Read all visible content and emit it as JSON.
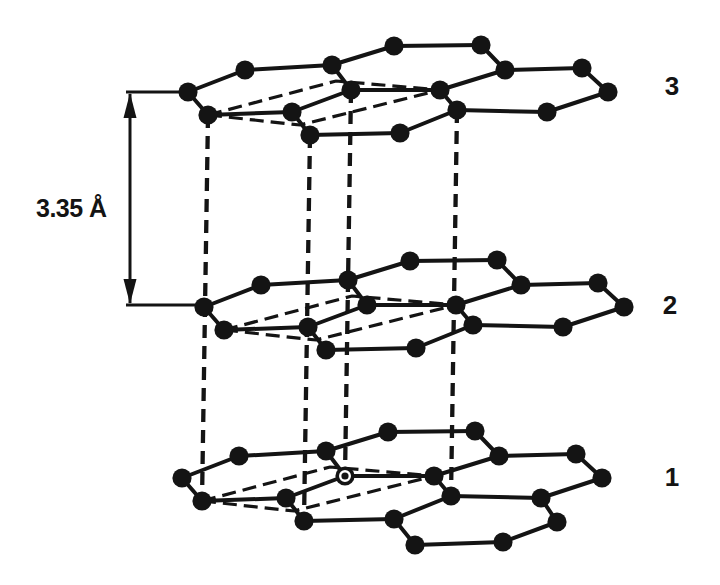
{
  "annotations": {
    "spacing_label": "3.35 Å",
    "layer_labels": [
      {
        "text": "3"
      },
      {
        "text": "2"
      },
      {
        "text": "1"
      }
    ]
  },
  "diagram": {
    "canvas": {
      "width": 720,
      "height": 585
    },
    "ink_color": "#141414",
    "background_color": "#ffffff",
    "atom_radius": 9.6,
    "template_atoms": {
      "A": [
        0,
        0
      ],
      "B": [
        57,
        -22
      ],
      "C": [
        20,
        23
      ],
      "D": [
        104,
        20
      ],
      "E": [
        144,
        -27
      ],
      "F": [
        163,
        -2
      ],
      "G": [
        122,
        43
      ],
      "H": [
        206,
        -46
      ],
      "I": [
        212,
        41
      ],
      "J": [
        252,
        -2
      ],
      "K": [
        269,
        18
      ],
      "L": [
        293,
        -47
      ],
      "M": [
        317,
        -22
      ],
      "N": [
        394,
        -24
      ],
      "O": [
        420,
        0
      ],
      "P": [
        359,
        20
      ]
    },
    "template_bonds": [
      [
        "A",
        "B"
      ],
      [
        "A",
        "C"
      ],
      [
        "B",
        "E"
      ],
      [
        "C",
        "D"
      ],
      [
        "D",
        "F"
      ],
      [
        "D",
        "G"
      ],
      [
        "E",
        "F"
      ],
      [
        "E",
        "H"
      ],
      [
        "F",
        "J"
      ],
      [
        "G",
        "I"
      ],
      [
        "H",
        "L"
      ],
      [
        "I",
        "K"
      ],
      [
        "J",
        "K"
      ],
      [
        "J",
        "M"
      ],
      [
        "L",
        "M"
      ],
      [
        "M",
        "N"
      ],
      [
        "N",
        "O"
      ],
      [
        "O",
        "P"
      ],
      [
        "P",
        "K"
      ]
    ],
    "lens_paths": [
      [
        [
          20,
          23
        ],
        [
          148,
          -11
        ],
        [
          252,
          -2
        ]
      ],
      [
        [
          20,
          23
        ],
        [
          112,
          33
        ],
        [
          252,
          -2
        ]
      ]
    ],
    "layers": [
      {
        "label": "3",
        "anchor": [
          188,
          92
        ]
      },
      {
        "label": "2",
        "anchor": [
          204,
          307
        ]
      },
      {
        "label": "1",
        "anchor": [
          182,
          478
        ],
        "extra_atoms": {
          "Q": [
            233,
            67
          ],
          "R": [
            321,
            64
          ],
          "S": [
            375,
            44
          ]
        },
        "extra_bonds": [
          [
            "I",
            "Q"
          ],
          [
            "Q",
            "R"
          ],
          [
            "R",
            "S"
          ],
          [
            "S",
            "P"
          ]
        ],
        "ringed_atom": "F"
      }
    ],
    "interlayer_bonds": [
      {
        "from": [
          0,
          "C"
        ],
        "to": [
          2,
          "C"
        ]
      },
      {
        "from": [
          0,
          "G"
        ],
        "to": [
          2,
          "G"
        ]
      },
      {
        "from": [
          0,
          "F"
        ],
        "to": [
          2,
          "F"
        ]
      },
      {
        "from": [
          0,
          "K"
        ],
        "to": [
          2,
          "K"
        ]
      }
    ],
    "spacing_arrow": {
      "x": 130,
      "y_top": 92,
      "y_bottom": 305,
      "tick_top_x2": 188,
      "tick_bottom_x2": 204,
      "head_len": 26,
      "head_half_width": 6.5
    },
    "stroke": {
      "bond_width": 4,
      "interlayer_width": 4.3,
      "interlayer_dash": "13 8",
      "lens_width": 3.2,
      "lens_dash": "14 7",
      "arrow_width": 3
    }
  }
}
